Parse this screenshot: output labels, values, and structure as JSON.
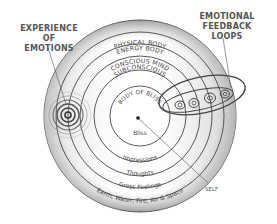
{
  "callouts": {
    "experience_of_emotions": [
      "EXPERIENCE OF",
      "EMOTIONS"
    ],
    "emotional_feedback_loops": [
      "EMOTIONAL",
      "FEEDBACK LOOPS"
    ],
    "self": "SELF"
  },
  "rings": [
    {
      "name": "PHYSICAL BODY",
      "inner_label": "Earth, Water, Fire, Air & Space"
    },
    {
      "name": "ENERGY BODY",
      "inner_label": "Gross Feelings"
    },
    {
      "name": "CONSCIOUS MIND",
      "inner_label": "Thoughts"
    },
    {
      "name": "SUBCONSCIOUS",
      "inner_label": "Impressions"
    },
    {
      "name": "BODY OF BLISS",
      "inner_label": "Bliss"
    }
  ],
  "colors": {
    "outer_band": "#a9a9a9",
    "band_light": "#e6e6e6",
    "stroke": "#333333",
    "text": "#444444"
  }
}
